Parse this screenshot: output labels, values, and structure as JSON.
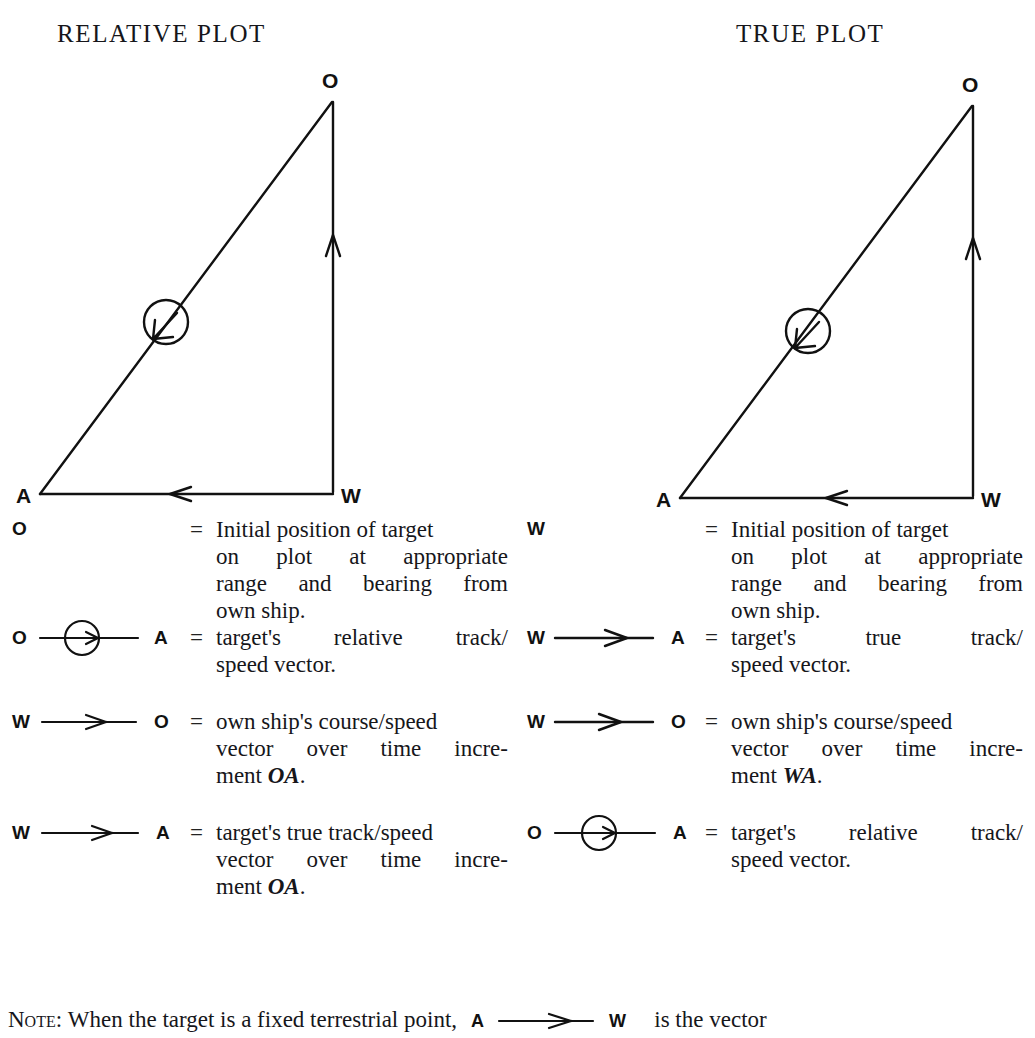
{
  "titles": {
    "relative": "RELATIVE PLOT",
    "true": "TRUE PLOT"
  },
  "figures": {
    "relative": {
      "name": "relative-plot-triangle",
      "vertex_top": "O",
      "vertex_left": "A",
      "vertex_right": "W"
    },
    "true": {
      "name": "true-plot-triangle",
      "vertex_top": "O",
      "vertex_left": "A",
      "vertex_right": "W"
    }
  },
  "legend_left": {
    "rows": [
      {
        "symbol": "point",
        "start_label": "O",
        "end_label": "",
        "equals": "=",
        "lines": [
          "Initial position of target",
          "on plot at appropriate",
          "range and bearing from",
          "own ship."
        ]
      },
      {
        "symbol": "circled-arrow",
        "start_label": "O",
        "end_label": "A",
        "equals": "=",
        "lines": [
          "target's relative track/",
          "speed vector."
        ]
      },
      {
        "symbol": "plain-arrow",
        "start_label": "W",
        "end_label": "O",
        "equals": "=",
        "lines": [
          "own ship's course/speed",
          "vector over time incre-",
          "ment OA."
        ]
      },
      {
        "symbol": "plain-arrow",
        "start_label": "W",
        "end_label": "A",
        "equals": "=",
        "lines": [
          "target's true track/speed",
          "vector over time incre-",
          "ment OA."
        ]
      }
    ]
  },
  "legend_right": {
    "rows": [
      {
        "symbol": "point",
        "start_label": "W",
        "end_label": "",
        "equals": "=",
        "lines": [
          "Initial position of target",
          "on plot at appropriate",
          "range and bearing from",
          "own ship."
        ]
      },
      {
        "symbol": "plain-arrow",
        "start_label": "W",
        "end_label": "A",
        "equals": "=",
        "lines": [
          "target's    true    track/",
          "speed vector."
        ]
      },
      {
        "symbol": "plain-arrow",
        "start_label": "W",
        "end_label": "O",
        "equals": "=",
        "lines": [
          "own ship's course/speed",
          "vector over time incre-",
          "ment WA."
        ]
      },
      {
        "symbol": "circled-arrow",
        "start_label": "O",
        "end_label": "A",
        "equals": "=",
        "lines": [
          "target's relative track/",
          "speed vector."
        ]
      }
    ]
  },
  "note": {
    "label": "Note",
    "colon": ":",
    "text_before": "When the target is a fixed terrestrial point,",
    "sym_start": "A",
    "sym_end": "W",
    "text_after": "is the vector"
  }
}
